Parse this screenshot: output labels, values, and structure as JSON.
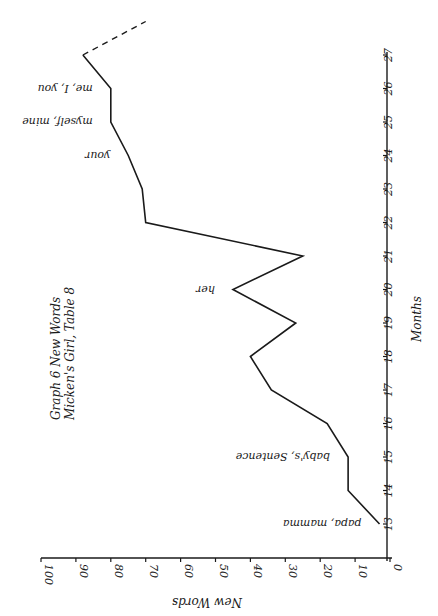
{
  "chart_data": {
    "type": "line",
    "orientation": "rotated-90-clockwise",
    "title": "Graph 6  New Words",
    "subtitle": "Micken's Girl, Table 8",
    "xlabel": "Months",
    "ylabel": "New Words",
    "x": [
      13,
      14,
      15,
      16,
      17,
      18,
      19,
      20,
      21,
      22,
      23,
      24,
      25,
      26,
      27
    ],
    "values": [
      3,
      12,
      12,
      18,
      34,
      40,
      27,
      45,
      25,
      70,
      71,
      75,
      80,
      80,
      88
    ],
    "x_ticks": [
      "13",
      "14",
      "15",
      "16",
      "17",
      "18",
      "19",
      "20",
      "21",
      "22",
      "23",
      "24",
      "25",
      "26",
      "27"
    ],
    "y_ticks": [
      "0",
      "10",
      "20",
      "30",
      "40",
      "50",
      "60",
      "70",
      "80",
      "90",
      "100"
    ],
    "ylim": [
      0,
      100
    ],
    "xlim": [
      12,
      27
    ],
    "extension": {
      "style": "dashed",
      "from_month": 27,
      "to_month": 28,
      "to_value": 70
    },
    "annotations": [
      {
        "month": 13,
        "text": "papa, mamma"
      },
      {
        "month": 15,
        "text": "baby's, Sentence"
      },
      {
        "month": 20,
        "text": "her"
      },
      {
        "month": 24,
        "text": "your"
      },
      {
        "month": 25,
        "text": "myself, mine"
      },
      {
        "month": 26,
        "text": "me, I, you"
      }
    ],
    "grid": false,
    "legend": null
  },
  "geometry": {
    "value_axis_y": 558,
    "zero_x": 390,
    "px_per_unit": 3.49,
    "month_axis_x": 387,
    "month_axis_top": 52,
    "month13_y": 524,
    "px_per_month": 33.5,
    "line_color": "#1a1a1a"
  }
}
